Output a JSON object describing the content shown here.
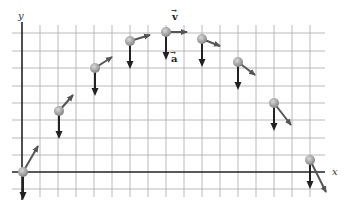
{
  "diagram": {
    "type": "projectile-motion",
    "axes": {
      "x_label": "x",
      "y_label": "y"
    },
    "labels": {
      "velocity": "v",
      "acceleration": "a",
      "vector_mark": "→"
    },
    "colors": {
      "grid": "#a8a8a8",
      "axis": "#222222",
      "ball": "#9a9a9a",
      "velocity_arrow": "#555555",
      "acceleration_arrow": "#222222"
    },
    "points": [
      {
        "x": 23,
        "y": 172,
        "vx": 38,
        "vy": 146,
        "ax": 23,
        "ay": 198
      },
      {
        "x": 59,
        "y": 111,
        "vx": 73,
        "vy": 95,
        "ax": 59,
        "ay": 137
      },
      {
        "x": 95,
        "y": 68,
        "vx": 112,
        "vy": 57,
        "ax": 95,
        "ay": 94
      },
      {
        "x": 130,
        "y": 41,
        "vx": 150,
        "vy": 35,
        "ax": 130,
        "ay": 67
      },
      {
        "x": 166,
        "y": 32,
        "vx": 187,
        "vy": 32,
        "ax": 166,
        "ay": 58
      },
      {
        "x": 202,
        "y": 39,
        "vx": 220,
        "vy": 46,
        "ax": 202,
        "ay": 65
      },
      {
        "x": 238,
        "y": 62,
        "vx": 255,
        "vy": 75,
        "ax": 238,
        "ay": 88
      },
      {
        "x": 274,
        "y": 103,
        "vx": 291,
        "vy": 125,
        "ax": 274,
        "ay": 129
      },
      {
        "x": 310,
        "y": 160,
        "vx": 326,
        "vy": 192,
        "ax": 310,
        "ay": 187
      }
    ]
  }
}
